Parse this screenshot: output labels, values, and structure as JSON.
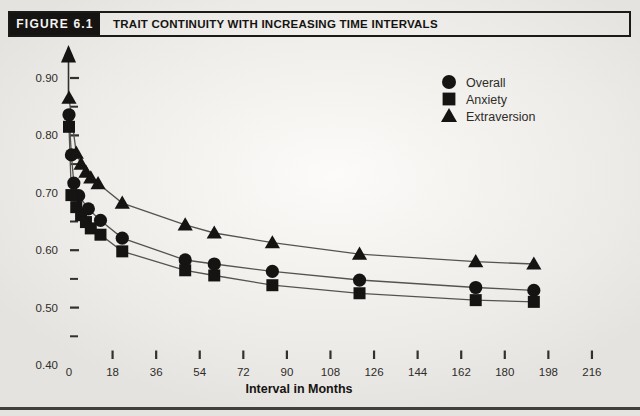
{
  "header": {
    "figure_label": "FIGURE 6.1",
    "title": "TRAIT CONTINUITY WITH INCREASING TIME INTERVALS"
  },
  "colors": {
    "ink": "#151412",
    "curve": "#56534f",
    "text": "#2e2c29",
    "tick": "#33312e",
    "header_box_bg": "#151412",
    "header_box_text": "#f5f4f1",
    "bottom_rule": "#413f3c"
  },
  "chart_data": {
    "type": "scatter",
    "title": "TRAIT CONTINUITY WITH INCREASING TIME INTERVALS",
    "xlabel": "Interval in Months",
    "ylabel": "",
    "xlim": [
      0,
      225
    ],
    "ylim": [
      0.4,
      0.93
    ],
    "grid": false,
    "legend_position": "upper-right",
    "x_ticks": [
      0,
      18,
      36,
      54,
      72,
      90,
      108,
      126,
      144,
      162,
      180,
      198,
      216
    ],
    "y_ticks_major": [
      0.9,
      0.8,
      0.7,
      0.6,
      0.5,
      0.4
    ],
    "y_ticks_minor": [
      0.85,
      0.75,
      0.65,
      0.55,
      0.45
    ],
    "series": [
      {
        "name": "Overall",
        "marker": "circle",
        "points": [
          [
            0,
            0.836
          ],
          [
            1,
            0.766
          ],
          [
            2,
            0.717
          ],
          [
            4,
            0.695
          ],
          [
            8,
            0.672
          ],
          [
            13,
            0.652
          ],
          [
            22,
            0.621
          ],
          [
            48,
            0.583
          ],
          [
            60,
            0.576
          ],
          [
            84,
            0.563
          ],
          [
            120,
            0.548
          ],
          [
            168,
            0.535
          ],
          [
            192,
            0.53
          ]
        ]
      },
      {
        "name": "Anxiety",
        "marker": "square",
        "points": [
          [
            0,
            0.815
          ],
          [
            1,
            0.696
          ],
          [
            3,
            0.675
          ],
          [
            5,
            0.661
          ],
          [
            7,
            0.649
          ],
          [
            9,
            0.638
          ],
          [
            13,
            0.627
          ],
          [
            22,
            0.598
          ],
          [
            48,
            0.565
          ],
          [
            60,
            0.556
          ],
          [
            84,
            0.539
          ],
          [
            120,
            0.525
          ],
          [
            168,
            0.513
          ],
          [
            192,
            0.51
          ]
        ]
      },
      {
        "name": "Extraversion",
        "marker": "triangle",
        "points": [
          [
            0,
            0.865
          ],
          [
            3,
            0.769
          ],
          [
            5,
            0.75
          ],
          [
            7,
            0.736
          ],
          [
            9,
            0.726
          ],
          [
            12,
            0.716
          ],
          [
            22,
            0.682
          ],
          [
            48,
            0.644
          ],
          [
            60,
            0.63
          ],
          [
            84,
            0.613
          ],
          [
            120,
            0.593
          ],
          [
            168,
            0.58
          ],
          [
            192,
            0.576
          ]
        ]
      }
    ]
  }
}
